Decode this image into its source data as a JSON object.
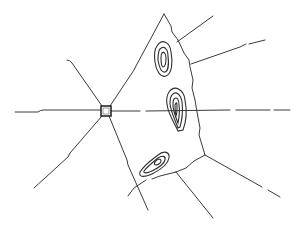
{
  "diagram": {
    "type": "voronoi-cell-sketch",
    "colors": {
      "line": "#3a3a3a",
      "contour": "#2e2e2e",
      "background": "#ffffff"
    },
    "node": {
      "x": 101,
      "y": 106,
      "size": 10,
      "shape": "square"
    },
    "axis": {
      "y": 111,
      "x_start": 15,
      "x_end": 290
    },
    "region_vertices": [
      [
        106,
        111
      ],
      [
        164,
        14
      ],
      [
        178,
        40
      ],
      [
        190,
        63
      ],
      [
        195,
        100
      ],
      [
        201,
        128
      ],
      [
        205,
        155
      ],
      [
        175,
        172
      ],
      [
        150,
        182
      ],
      [
        127,
        198
      ],
      [
        106,
        111
      ]
    ],
    "radial_lines": [
      {
        "from": [
          106,
          111
        ],
        "to": [
          67,
          61
        ]
      },
      {
        "from": [
          106,
          111
        ],
        "to": [
          33,
          188
        ]
      },
      {
        "from": [
          106,
          111
        ],
        "to": [
          148,
          210
        ]
      },
      {
        "from": [
          178,
          40
        ],
        "to": [
          213,
          16
        ]
      },
      {
        "from": [
          190,
          63
        ],
        "to": [
          265,
          40
        ]
      },
      {
        "from": [
          205,
          155
        ],
        "to": [
          280,
          197
        ]
      },
      {
        "from": [
          175,
          172
        ],
        "to": [
          213,
          218
        ]
      }
    ],
    "contour_clusters": [
      {
        "name": "upper",
        "center": [
          162,
          57
        ],
        "levels": 3
      },
      {
        "name": "middle",
        "center": [
          176,
          110
        ],
        "levels": 4
      },
      {
        "name": "lower",
        "center": [
          152,
          166
        ],
        "levels": 3
      }
    ]
  }
}
